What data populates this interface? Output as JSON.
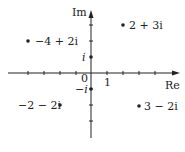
{
  "diagram": {
    "type": "complex-plane",
    "axes": {
      "x_label": "Re",
      "y_label": "Im",
      "origin_label": "0",
      "x_unit_label": "1",
      "y_pos_unit_label": "i",
      "y_neg_unit_label": "−i"
    },
    "points": [
      {
        "re": 2,
        "im": 3,
        "label": "2 + 3i"
      },
      {
        "re": -4,
        "im": 2,
        "label": "−4 + 2i"
      },
      {
        "re": -2,
        "im": -2,
        "label": "−2 − 2i"
      },
      {
        "re": 3,
        "im": -2,
        "label": "3 − 2i"
      }
    ],
    "colors": {
      "ink": "#222222",
      "background": "#ffffff"
    }
  }
}
